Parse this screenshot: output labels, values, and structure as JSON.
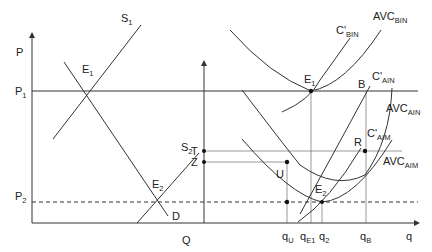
{
  "diagram": {
    "left_panel": {
      "y_axis_label": "P",
      "x_axis_label": "Q",
      "price_levels": [
        {
          "label": "P",
          "sub": "1"
        },
        {
          "label": "P",
          "sub": "2"
        }
      ],
      "curves": [
        {
          "label": "S",
          "sub": "1"
        },
        {
          "label": "S",
          "sub": "2"
        },
        {
          "label": "D",
          "sub": ""
        }
      ],
      "points": [
        {
          "label": "E",
          "sub": "1"
        },
        {
          "label": "E",
          "sub": "2"
        }
      ],
      "markers": [
        {
          "label": "T"
        },
        {
          "label": "Z"
        }
      ]
    },
    "right_panel": {
      "x_axis_label": "q",
      "curves": [
        {
          "label": "C'",
          "sub": "BIN"
        },
        {
          "label": "AVC",
          "sub": "BIN"
        },
        {
          "label": "C'",
          "sub": "AIN"
        },
        {
          "label": "AVC",
          "sub": "AIN"
        },
        {
          "label": "C'",
          "sub": "AIM"
        },
        {
          "label": "AVC",
          "sub": "AIM"
        }
      ],
      "points": [
        {
          "label": "E",
          "sub": "1"
        },
        {
          "label": "B",
          "sub": ""
        },
        {
          "label": "R",
          "sub": ""
        },
        {
          "label": "U",
          "sub": ""
        },
        {
          "label": "E",
          "sub": "2"
        }
      ],
      "x_ticks": [
        {
          "label": "q",
          "sub": "U"
        },
        {
          "label": "q",
          "sub": "E1"
        },
        {
          "label": "q",
          "sub": "2"
        },
        {
          "label": "q",
          "sub": "B"
        }
      ]
    }
  }
}
